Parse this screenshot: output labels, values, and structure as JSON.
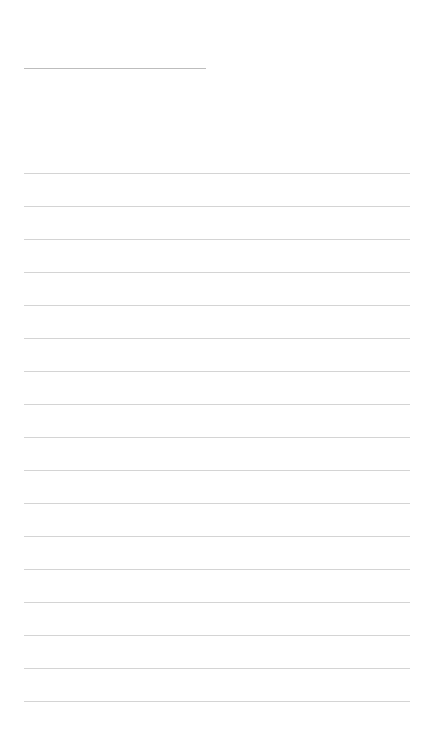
{
  "page": {
    "background": "#ffffff",
    "line_color": "#d4d4d4",
    "title_line_color": "#bdbdbd",
    "title_text": "",
    "ruled_line_count": 17,
    "ruled_lines": [
      {
        "text": ""
      },
      {
        "text": ""
      },
      {
        "text": ""
      },
      {
        "text": ""
      },
      {
        "text": ""
      },
      {
        "text": ""
      },
      {
        "text": ""
      },
      {
        "text": ""
      },
      {
        "text": ""
      },
      {
        "text": ""
      },
      {
        "text": ""
      },
      {
        "text": ""
      },
      {
        "text": ""
      },
      {
        "text": ""
      },
      {
        "text": ""
      },
      {
        "text": ""
      },
      {
        "text": ""
      }
    ]
  }
}
